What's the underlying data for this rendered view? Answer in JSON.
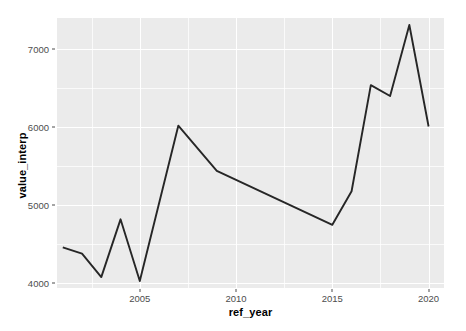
{
  "chart_data": {
    "type": "line",
    "title": "",
    "xlabel": "ref_year",
    "ylabel": "value_interp",
    "xlim": [
      2000.7,
      2020.8
    ],
    "ylim": [
      3940,
      7400
    ],
    "grid": true,
    "legend": "none",
    "x_ticks": [
      2005,
      2010,
      2015,
      2020
    ],
    "x_tick_labels": [
      "2005",
      "2010",
      "2015",
      "2020"
    ],
    "y_ticks": [
      4000,
      5000,
      6000,
      7000
    ],
    "y_tick_labels": [
      "4000",
      "5000",
      "6000",
      "7000"
    ],
    "x_minor_ticks": [
      2002.5,
      2007.5,
      2012.5,
      2017.5
    ],
    "y_minor_ticks": [
      4500,
      5500,
      6500
    ],
    "series": [
      {
        "name": "value_interp",
        "color": "#262626",
        "x": [
          2001,
          2002,
          2003,
          2004,
          2005,
          2007,
          2009,
          2015,
          2016,
          2017,
          2018,
          2019,
          2020
        ],
        "y": [
          4460,
          4380,
          4080,
          4820,
          4030,
          6020,
          5440,
          4750,
          5180,
          6540,
          6400,
          7310,
          6010
        ]
      }
    ]
  },
  "axes": {
    "y_title": "value_interp",
    "x_title": "ref_year"
  },
  "theme": {
    "panel_background": "#ebebeb",
    "grid_color": "#ffffff",
    "line_color": "#262626",
    "text_color": "#000000",
    "tick_label_color": "#4d4d4d",
    "plot_background": "#ffffff"
  }
}
